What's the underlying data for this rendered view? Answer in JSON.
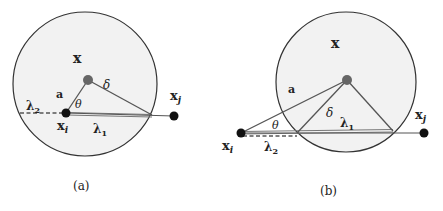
{
  "figure": {
    "background": "#ffffff",
    "circle_fill": "#f2f2f2",
    "circle_stroke": "#333333",
    "line_color": "#555555",
    "point_color": "#111111",
    "center_color": "#666666",
    "panels": [
      {
        "id": "a",
        "caption": "(a)",
        "labels": {
          "center": "x",
          "a": "a",
          "delta": "δ",
          "theta": "θ",
          "lambda1": "λ",
          "lambda1_sub": "1",
          "lambda2": "λ",
          "lambda2_sub": "2",
          "xi": "x",
          "xi_sub": "i",
          "xj": "x",
          "xj_sub": "j"
        }
      },
      {
        "id": "b",
        "caption": "(b)",
        "labels": {
          "center": "x",
          "a": "a",
          "delta": "δ",
          "theta": "θ",
          "lambda1": "λ",
          "lambda1_sub": "1",
          "lambda2": "λ",
          "lambda2_sub": "2",
          "xi": "x",
          "xi_sub": "i",
          "xj": "x",
          "xj_sub": "j"
        }
      }
    ]
  }
}
